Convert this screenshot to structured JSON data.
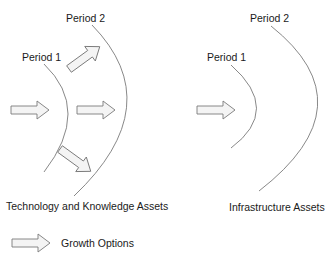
{
  "left_panel": {
    "period1_label": "Period 1",
    "period2_label": "Period 2",
    "caption": "Technology and Knowledge Assets"
  },
  "right_panel": {
    "period1_label": "Period 1",
    "period2_label": "Period 2",
    "caption": "Infrastructure Assets"
  },
  "legend": {
    "arrow_icon": "block-arrow-icon",
    "label": "Growth Options"
  },
  "colors": {
    "line": "#7a7a7a",
    "arrow_fill": "#f4f4f4",
    "arrow_stroke": "#7a7a7a",
    "text": "#1a1a1a"
  }
}
